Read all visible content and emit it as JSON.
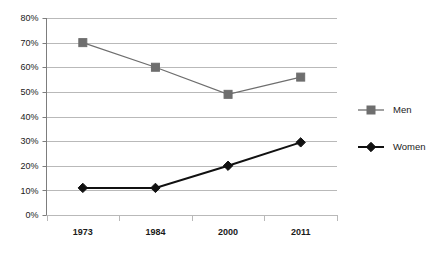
{
  "chart_data": {
    "type": "line",
    "title": "",
    "subtitle": "",
    "xlabel": "",
    "ylabel": "",
    "categories": [
      "1973",
      "1984",
      "2000",
      "2011"
    ],
    "series": [
      {
        "name": "Men",
        "values": [
          70,
          60,
          49,
          56
        ],
        "color": "#6e6e6e",
        "marker": "square"
      },
      {
        "name": "Women",
        "values": [
          11,
          11,
          20,
          29.5
        ],
        "color": "#111111",
        "marker": "diamond"
      }
    ],
    "ylim": [
      0,
      80
    ],
    "ytick_step": 10,
    "ytick_labels": [
      "0%",
      "10%",
      "20%",
      "30%",
      "40%",
      "50%",
      "60%",
      "70%",
      "80%"
    ],
    "ytick_values": [
      0,
      10,
      20,
      30,
      40,
      50,
      60,
      70,
      80
    ],
    "grid": true,
    "grid_axis": "y",
    "grid_color": "#b9b9b9",
    "axis_color": "#7d7d7d",
    "legend_position": "right",
    "legend_entries": [
      "Men",
      "Women"
    ]
  },
  "legend": {
    "items": [
      {
        "label": "Men"
      },
      {
        "label": "Women"
      }
    ]
  },
  "axes": {
    "y_labels": [
      "80%",
      "70%",
      "60%",
      "50%",
      "40%",
      "30%",
      "20%",
      "10%",
      "0%"
    ],
    "x_labels": [
      "1973",
      "1984",
      "2000",
      "2011"
    ]
  }
}
